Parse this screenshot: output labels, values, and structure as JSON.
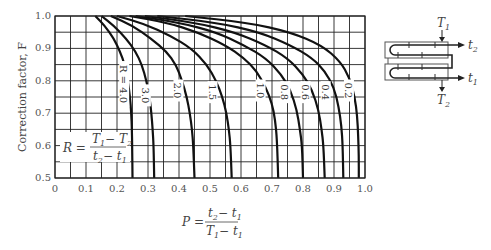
{
  "chart_data": {
    "type": "line",
    "title": "",
    "xlabel": "P = (t2 - t1) / (T1 - t1)",
    "ylabel": "Correction factor, F",
    "xlim": [
      0,
      1.0
    ],
    "ylim": [
      0.5,
      1.0
    ],
    "grid": true,
    "grid_step_x": 0.05,
    "grid_step_y": 0.05,
    "x_ticks": [
      "0",
      "0.1",
      "0.2",
      "0.3",
      "0.4",
      "0.5",
      "0.6",
      "0.7",
      "0.8",
      "0.9",
      "1.0"
    ],
    "y_ticks": [
      "0.5",
      "0.6",
      "0.7",
      "0.8",
      "0.9",
      "1.0"
    ],
    "legend_position": "none (inline curve labels)",
    "series": [
      {
        "name": "R = 4.0",
        "label": "R = 4.0",
        "x_at_F_1": 0.13,
        "x_at_F_0_5": 0.25,
        "points": [
          [
            0.13,
            1.0
          ],
          [
            0.16,
            0.97
          ],
          [
            0.19,
            0.93
          ],
          [
            0.21,
            0.89
          ],
          [
            0.225,
            0.85
          ],
          [
            0.235,
            0.8
          ],
          [
            0.242,
            0.75
          ],
          [
            0.246,
            0.7
          ],
          [
            0.248,
            0.65
          ],
          [
            0.249,
            0.6
          ],
          [
            0.25,
            0.5
          ]
        ]
      },
      {
        "name": "R = 3.0",
        "label": "3.0",
        "x_at_F_1": 0.15,
        "x_at_F_0_5": 0.32,
        "points": [
          [
            0.15,
            1.0
          ],
          [
            0.19,
            0.97
          ],
          [
            0.23,
            0.93
          ],
          [
            0.26,
            0.89
          ],
          [
            0.28,
            0.85
          ],
          [
            0.295,
            0.8
          ],
          [
            0.305,
            0.75
          ],
          [
            0.311,
            0.7
          ],
          [
            0.315,
            0.65
          ],
          [
            0.318,
            0.6
          ],
          [
            0.32,
            0.5
          ]
        ]
      },
      {
        "name": "R = 2.0",
        "label": "2.0",
        "x_at_F_1": 0.18,
        "x_at_F_0_5": 0.45,
        "points": [
          [
            0.18,
            1.0
          ],
          [
            0.25,
            0.97
          ],
          [
            0.31,
            0.93
          ],
          [
            0.36,
            0.89
          ],
          [
            0.39,
            0.85
          ],
          [
            0.41,
            0.8
          ],
          [
            0.425,
            0.75
          ],
          [
            0.435,
            0.7
          ],
          [
            0.442,
            0.65
          ],
          [
            0.446,
            0.6
          ],
          [
            0.45,
            0.5
          ]
        ]
      },
      {
        "name": "R = 1.5",
        "label": "1.5",
        "x_at_F_1": 0.2,
        "x_at_F_0_5": 0.57,
        "points": [
          [
            0.2,
            1.0
          ],
          [
            0.29,
            0.975
          ],
          [
            0.37,
            0.94
          ],
          [
            0.44,
            0.9
          ],
          [
            0.49,
            0.85
          ],
          [
            0.52,
            0.8
          ],
          [
            0.54,
            0.75
          ],
          [
            0.553,
            0.7
          ],
          [
            0.561,
            0.65
          ],
          [
            0.566,
            0.6
          ],
          [
            0.57,
            0.5
          ]
        ]
      },
      {
        "name": "R = 1.0",
        "label": "1.0",
        "x_at_F_1": 0.24,
        "x_at_F_0_5": 0.72,
        "points": [
          [
            0.24,
            1.0
          ],
          [
            0.36,
            0.98
          ],
          [
            0.46,
            0.95
          ],
          [
            0.55,
            0.91
          ],
          [
            0.61,
            0.87
          ],
          [
            0.65,
            0.83
          ],
          [
            0.68,
            0.78
          ],
          [
            0.7,
            0.73
          ],
          [
            0.71,
            0.68
          ],
          [
            0.716,
            0.62
          ],
          [
            0.72,
            0.5
          ]
        ]
      },
      {
        "name": "R = 0.8",
        "label": "0.8",
        "x_at_F_1": 0.26,
        "x_at_F_0_5": 0.8,
        "points": [
          [
            0.26,
            1.0
          ],
          [
            0.4,
            0.98
          ],
          [
            0.52,
            0.95
          ],
          [
            0.61,
            0.91
          ],
          [
            0.68,
            0.87
          ],
          [
            0.73,
            0.82
          ],
          [
            0.76,
            0.77
          ],
          [
            0.78,
            0.71
          ],
          [
            0.79,
            0.65
          ],
          [
            0.797,
            0.6
          ],
          [
            0.8,
            0.5
          ]
        ]
      },
      {
        "name": "R = 0.6",
        "label": "0.6",
        "x_at_F_1": 0.29,
        "x_at_F_0_5": 0.87,
        "points": [
          [
            0.29,
            1.0
          ],
          [
            0.45,
            0.98
          ],
          [
            0.58,
            0.95
          ],
          [
            0.68,
            0.91
          ],
          [
            0.75,
            0.87
          ],
          [
            0.8,
            0.82
          ],
          [
            0.83,
            0.77
          ],
          [
            0.85,
            0.71
          ],
          [
            0.86,
            0.65
          ],
          [
            0.866,
            0.6
          ],
          [
            0.87,
            0.5
          ]
        ]
      },
      {
        "name": "R = 0.4",
        "label": "0.4",
        "x_at_F_1": 0.33,
        "x_at_F_0_5": 0.93,
        "points": [
          [
            0.33,
            1.0
          ],
          [
            0.52,
            0.98
          ],
          [
            0.66,
            0.95
          ],
          [
            0.76,
            0.91
          ],
          [
            0.83,
            0.87
          ],
          [
            0.87,
            0.83
          ],
          [
            0.9,
            0.78
          ],
          [
            0.915,
            0.72
          ],
          [
            0.924,
            0.66
          ],
          [
            0.928,
            0.6
          ],
          [
            0.93,
            0.5
          ]
        ]
      },
      {
        "name": "R = 0.2",
        "label": "0.2",
        "x_at_F_1": 0.42,
        "x_at_F_0_5": 0.98,
        "points": [
          [
            0.42,
            1.0
          ],
          [
            0.62,
            0.98
          ],
          [
            0.76,
            0.95
          ],
          [
            0.86,
            0.91
          ],
          [
            0.92,
            0.86
          ],
          [
            0.95,
            0.81
          ],
          [
            0.967,
            0.75
          ],
          [
            0.975,
            0.69
          ],
          [
            0.978,
            0.63
          ],
          [
            0.98,
            0.57
          ],
          [
            0.98,
            0.5
          ]
        ]
      }
    ],
    "curve_label_positions": [
      {
        "label": "R = 4.0",
        "x": 0.22,
        "y": 0.79
      },
      {
        "label": "3.0",
        "x": 0.29,
        "y": 0.755
      },
      {
        "label": "2.0",
        "x": 0.395,
        "y": 0.77
      },
      {
        "label": "1.5",
        "x": 0.505,
        "y": 0.765
      },
      {
        "label": "1.0",
        "x": 0.66,
        "y": 0.77
      },
      {
        "label": "0.8",
        "x": 0.74,
        "y": 0.765
      },
      {
        "label": "0.6",
        "x": 0.805,
        "y": 0.765
      },
      {
        "label": "0.4",
        "x": 0.87,
        "y": 0.765
      },
      {
        "label": "0.2",
        "x": 0.945,
        "y": 0.77
      }
    ],
    "annotations": [
      {
        "text": "R = (T1 - T2) / (t2 - t1)",
        "position": "lower-left inside plot"
      },
      {
        "text": "P = (t2 - t1) / (T1 - t1)",
        "position": "below x-axis"
      }
    ]
  },
  "formulas": {
    "R": {
      "lhs": "R",
      "num_a": "T",
      "num_a_sub": "1",
      "num_b": "T",
      "num_b_sub": "2",
      "den_a": "t",
      "den_a_sub": "2",
      "den_b": "t",
      "den_b_sub": "1"
    },
    "P": {
      "lhs": "P",
      "num_a": "t",
      "num_a_sub": "2",
      "num_b": "t",
      "num_b_sub": "1",
      "den_a": "T",
      "den_a_sub": "1",
      "den_b": "t",
      "den_b_sub": "1"
    }
  },
  "schematic": {
    "title": "Two shell passes, four tube passes",
    "labels": {
      "T1": "T",
      "T1_sub": "1",
      "T2": "T",
      "T2_sub": "2",
      "t1": "t",
      "t1_sub": "1",
      "t2": "t",
      "t2_sub": "2"
    }
  }
}
